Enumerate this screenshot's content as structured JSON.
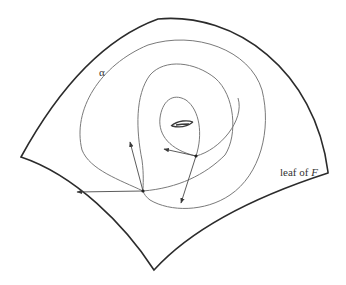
{
  "figure": {
    "labels": {
      "curve": "α",
      "leaf_prefix": "leaf of ",
      "leaf_var": "F"
    },
    "colors": {
      "boundary": "#2b2b2b",
      "curve": "#7a7a7a",
      "arrow": "#4a4a4a",
      "background": "#ffffff"
    },
    "marked_points": 2,
    "arrows": 4
  }
}
